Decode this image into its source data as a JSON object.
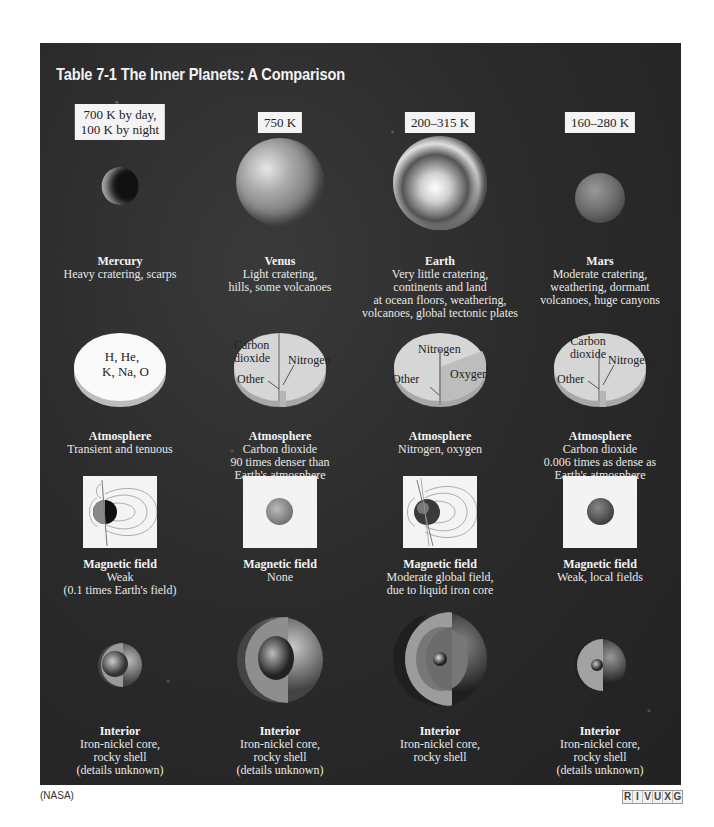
{
  "table": {
    "title": "Table 7-1  The Inner Planets: A Comparison",
    "planets": [
      {
        "name": "Mercury",
        "temperature": [
          "700 K by day,",
          "100 K by night"
        ],
        "surface": [
          "Heavy cratering, scarps"
        ],
        "atmosphere_pie_labels": [
          "H, He,",
          "K, Na, O"
        ],
        "atmosphere": [
          "Transient and tenuous"
        ],
        "magnetic_field": [
          "Weak",
          "(0.1 times Earth's field)"
        ],
        "interior": [
          "Iron-nickel core,",
          "rocky shell",
          "(details unknown)"
        ]
      },
      {
        "name": "Venus",
        "temperature": [
          "750 K"
        ],
        "surface": [
          "Light cratering,",
          "hills, some volcanoes"
        ],
        "atmosphere_pie_labels": [
          "Carbon",
          "dioxide",
          "Nitrogen",
          "Other"
        ],
        "atmosphere": [
          "Carbon dioxide",
          "90 times denser than",
          "Earth's atmosphere"
        ],
        "magnetic_field": [
          "None"
        ],
        "interior": [
          "Iron-nickel core,",
          "rocky shell",
          "(details unknown)"
        ]
      },
      {
        "name": "Earth",
        "temperature": [
          "200–315 K"
        ],
        "surface": [
          "Very little cratering,",
          "continents and land",
          "at ocean floors, weathering,",
          "volcanoes, global tectonic plates"
        ],
        "atmosphere_pie_labels": [
          "Nitrogen",
          "Oxygen",
          "Other"
        ],
        "atmosphere": [
          "Nitrogen, oxygen"
        ],
        "magnetic_field": [
          "Moderate global field,",
          "due to liquid iron core"
        ],
        "interior": [
          "Iron-nickel core,",
          "rocky shell"
        ]
      },
      {
        "name": "Mars",
        "temperature": [
          "160–280 K"
        ],
        "surface": [
          "Moderate cratering,",
          "weathering, dormant",
          "volcanoes, huge canyons"
        ],
        "atmosphere_pie_labels": [
          "Carbon",
          "dioxide",
          "Nitrogen",
          "Other"
        ],
        "atmosphere": [
          "Carbon dioxide",
          "0.006 times as dense as",
          "Earth's atmosphere"
        ],
        "magnetic_field": [
          "Weak, local fields"
        ],
        "interior": [
          "Iron-nickel core,",
          "rocky shell",
          "(details unknown)"
        ]
      }
    ],
    "row_headings": {
      "atmosphere": "Atmosphere",
      "magnetic_field": "Magnetic field",
      "interior": "Interior"
    }
  },
  "footer": {
    "credit": "(NASA)",
    "wavelength_bands": [
      "R",
      "I",
      "V",
      "U",
      "X",
      "G"
    ]
  },
  "colors": {
    "panel_bg": "#2b2b2b",
    "label_box": "#f4f4f4",
    "pie_light": "#d8d8d8",
    "text_light": "#e8e8e8"
  }
}
